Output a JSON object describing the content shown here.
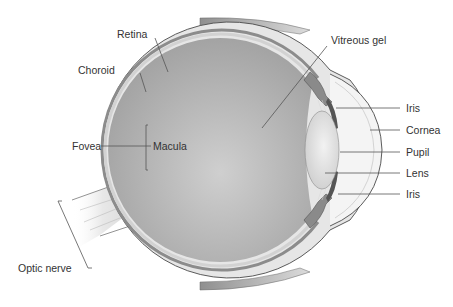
{
  "diagram": {
    "colors": {
      "background": "#ffffff",
      "vitreous": "#a9a9a9",
      "vitreous_light": "#dcdcdc",
      "sclera": "#e6e6e6",
      "sclera_outline": "#4a4a4a",
      "choroid": "#8c8c8c",
      "retina": "#d2d2d2",
      "muscle": "#9a9a9a",
      "lens": "#e2e2e2",
      "iris": "#555555",
      "label_text": "#333333",
      "leader_line": "#555555"
    },
    "labels": {
      "retina": "Retina",
      "choroid": "Choroid",
      "fovea": "Fovea",
      "macula": "Macula",
      "vitreous_gel": "Vitreous gel",
      "iris_top": "Iris",
      "cornea": "Cornea",
      "pupil": "Pupil",
      "lens": "Lens",
      "iris_bottom": "Iris",
      "optic_nerve": "Optic nerve"
    }
  }
}
